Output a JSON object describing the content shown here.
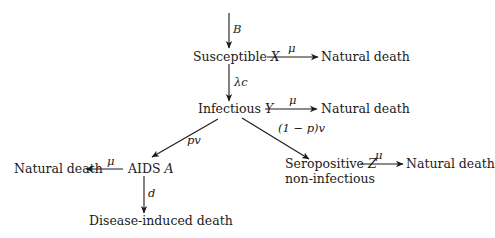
{
  "diagram": {
    "type": "compartmental-flow",
    "nodes": {
      "susceptible": {
        "label": "Susceptible",
        "var": "X"
      },
      "infectious": {
        "label": "Infectious",
        "var": "Y"
      },
      "aids": {
        "label": "AIDS",
        "var": "A"
      },
      "seropositive": {
        "label": "Seropositive",
        "var": "Z",
        "sublabel": "non-infectious"
      },
      "natural_death_x": {
        "label": "Natural death"
      },
      "natural_death_y": {
        "label": "Natural death"
      },
      "natural_death_a": {
        "label": "Natural death"
      },
      "natural_death_z": {
        "label": "Natural death"
      },
      "disease_death": {
        "label": "Disease-induced death"
      }
    },
    "edges": {
      "birth": {
        "from": "",
        "to": "susceptible",
        "label": "B"
      },
      "infection": {
        "from": "susceptible",
        "to": "infectious",
        "label": "λc"
      },
      "x_death": {
        "from": "susceptible",
        "to": "natural_death_x",
        "label": "μ"
      },
      "y_death": {
        "from": "infectious",
        "to": "natural_death_y",
        "label": "μ"
      },
      "to_aids": {
        "from": "infectious",
        "to": "aids",
        "label": "pv"
      },
      "to_sero": {
        "from": "infectious",
        "to": "seropositive",
        "label": "(1 − p)v"
      },
      "a_death": {
        "from": "aids",
        "to": "natural_death_a",
        "label": "μ"
      },
      "a_disease_death": {
        "from": "aids",
        "to": "disease_death",
        "label": "d"
      },
      "z_death": {
        "from": "seropositive",
        "to": "natural_death_z",
        "label": "μ"
      }
    },
    "colors": {
      "ink": "#1a1a1a",
      "background": "#ffffff"
    }
  }
}
